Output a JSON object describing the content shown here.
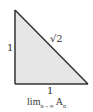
{
  "diagram": {
    "shape": "right-triangle",
    "fill_color": "#e6e6e6",
    "stroke_color": "#333333",
    "vertices": {
      "top": [
        15,
        10
      ],
      "bottom_left": [
        15,
        84
      ],
      "bottom_right": [
        88,
        84
      ]
    },
    "labels": {
      "left_side": "1",
      "bottom_side": "1",
      "hypotenuse": "√2"
    },
    "caption": {
      "base": "lim",
      "subscript": "n→∞",
      "term": "A",
      "term_subscript": "n"
    }
  }
}
